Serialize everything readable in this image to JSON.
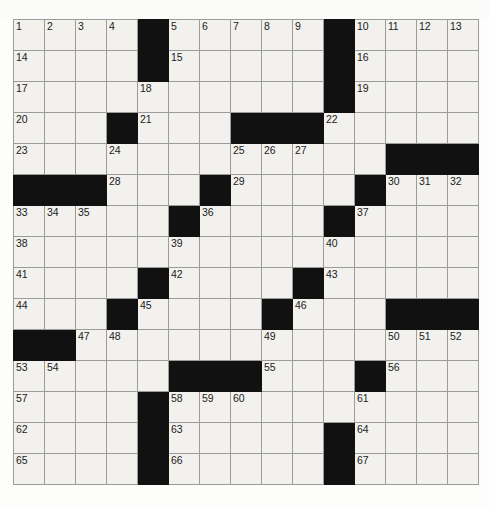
{
  "puzzle": {
    "title": "Crossword Grid",
    "rows": 15,
    "cols": 15,
    "cell_size_px": 30,
    "colors": {
      "page_background": "#fdfdfc",
      "cell_fill": "#f2f1ee",
      "block_fill": "#111111",
      "grid_line": "#9b9b9b",
      "border": "#8a8a8a",
      "number_text": "#1b1b1b"
    },
    "block_count": 72,
    "white_count": 153,
    "max_clue_number": 67,
    "grid": [
      [
        0,
        0,
        0,
        0,
        1,
        0,
        0,
        0,
        0,
        0,
        1,
        0,
        0,
        0,
        0
      ],
      [
        0,
        0,
        0,
        0,
        1,
        0,
        0,
        0,
        0,
        0,
        1,
        0,
        0,
        0,
        0
      ],
      [
        0,
        0,
        0,
        0,
        0,
        0,
        0,
        0,
        0,
        0,
        1,
        0,
        0,
        0,
        0
      ],
      [
        0,
        0,
        0,
        1,
        0,
        0,
        0,
        1,
        1,
        1,
        0,
        0,
        0,
        0,
        0
      ],
      [
        0,
        0,
        0,
        0,
        0,
        0,
        0,
        0,
        0,
        0,
        0,
        0,
        1,
        1,
        1
      ],
      [
        1,
        1,
        1,
        0,
        0,
        0,
        1,
        0,
        0,
        0,
        0,
        1,
        0,
        0,
        0
      ],
      [
        0,
        0,
        0,
        0,
        0,
        1,
        0,
        0,
        0,
        0,
        1,
        0,
        0,
        0,
        0
      ],
      [
        0,
        0,
        0,
        0,
        0,
        0,
        0,
        0,
        0,
        0,
        0,
        0,
        0,
        0,
        0
      ],
      [
        0,
        0,
        0,
        0,
        1,
        0,
        0,
        0,
        0,
        1,
        0,
        0,
        0,
        0,
        0
      ],
      [
        0,
        0,
        0,
        1,
        0,
        0,
        0,
        0,
        1,
        0,
        0,
        0,
        1,
        1,
        1
      ],
      [
        1,
        1,
        0,
        0,
        0,
        0,
        0,
        0,
        0,
        0,
        0,
        0,
        0,
        0,
        0
      ],
      [
        0,
        0,
        0,
        0,
        0,
        1,
        1,
        1,
        0,
        0,
        0,
        1,
        0,
        0,
        0
      ],
      [
        0,
        0,
        0,
        0,
        1,
        0,
        0,
        0,
        0,
        0,
        0,
        0,
        0,
        0,
        0
      ],
      [
        0,
        0,
        0,
        0,
        1,
        0,
        0,
        0,
        0,
        0,
        1,
        0,
        0,
        0,
        0
      ],
      [
        0,
        0,
        0,
        0,
        1,
        0,
        0,
        0,
        0,
        0,
        1,
        0,
        0,
        0,
        0
      ]
    ],
    "numbers": [
      [
        1,
        2,
        3,
        4,
        null,
        5,
        6,
        7,
        8,
        9,
        null,
        10,
        11,
        12,
        13
      ],
      [
        14,
        null,
        null,
        null,
        null,
        15,
        null,
        null,
        null,
        null,
        null,
        16,
        null,
        null,
        null
      ],
      [
        17,
        null,
        null,
        null,
        18,
        null,
        null,
        null,
        null,
        null,
        null,
        19,
        null,
        null,
        null
      ],
      [
        20,
        null,
        null,
        null,
        21,
        null,
        null,
        null,
        null,
        null,
        22,
        null,
        null,
        null,
        null
      ],
      [
        23,
        null,
        null,
        24,
        null,
        null,
        null,
        25,
        26,
        27,
        null,
        null,
        null,
        null,
        null
      ],
      [
        null,
        null,
        null,
        28,
        null,
        null,
        null,
        29,
        null,
        null,
        null,
        null,
        30,
        31,
        32
      ],
      [
        33,
        34,
        35,
        null,
        null,
        null,
        36,
        null,
        null,
        null,
        null,
        37,
        null,
        null,
        null
      ],
      [
        38,
        null,
        null,
        null,
        null,
        39,
        null,
        null,
        null,
        null,
        40,
        null,
        null,
        null,
        null
      ],
      [
        41,
        null,
        null,
        null,
        null,
        42,
        null,
        null,
        null,
        null,
        43,
        null,
        null,
        null,
        null
      ],
      [
        44,
        null,
        null,
        null,
        45,
        null,
        null,
        null,
        null,
        46,
        null,
        null,
        null,
        null,
        null
      ],
      [
        null,
        null,
        47,
        48,
        null,
        null,
        null,
        null,
        49,
        null,
        null,
        null,
        50,
        51,
        52
      ],
      [
        53,
        54,
        null,
        null,
        null,
        null,
        null,
        null,
        55,
        null,
        null,
        null,
        56,
        null,
        null
      ],
      [
        57,
        null,
        null,
        null,
        null,
        58,
        59,
        60,
        null,
        null,
        null,
        61,
        null,
        null,
        null
      ],
      [
        62,
        null,
        null,
        null,
        null,
        63,
        null,
        null,
        null,
        null,
        null,
        64,
        null,
        null,
        null
      ],
      [
        65,
        null,
        null,
        null,
        null,
        66,
        null,
        null,
        null,
        null,
        null,
        67,
        null,
        null,
        null
      ]
    ],
    "letters": [
      [
        "",
        "",
        "",
        "",
        "",
        "",
        "",
        "",
        "",
        "",
        "",
        "",
        "",
        "",
        ""
      ],
      [
        "",
        "",
        "",
        "",
        "",
        "",
        "",
        "",
        "",
        "",
        "",
        "",
        "",
        "",
        ""
      ],
      [
        "",
        "",
        "",
        "",
        "",
        "",
        "",
        "",
        "",
        "",
        "",
        "",
        "",
        "",
        ""
      ],
      [
        "",
        "",
        "",
        "",
        "",
        "",
        "",
        "",
        "",
        "",
        "",
        "",
        "",
        "",
        ""
      ],
      [
        "",
        "",
        "",
        "",
        "",
        "",
        "",
        "",
        "",
        "",
        "",
        "",
        "",
        "",
        ""
      ],
      [
        "",
        "",
        "",
        "",
        "",
        "",
        "",
        "",
        "",
        "",
        "",
        "",
        "",
        "",
        ""
      ],
      [
        "",
        "",
        "",
        "",
        "",
        "",
        "",
        "",
        "",
        "",
        "",
        "",
        "",
        "",
        ""
      ],
      [
        "",
        "",
        "",
        "",
        "",
        "",
        "",
        "",
        "",
        "",
        "",
        "",
        "",
        "",
        ""
      ],
      [
        "",
        "",
        "",
        "",
        "",
        "",
        "",
        "",
        "",
        "",
        "",
        "",
        "",
        "",
        ""
      ],
      [
        "",
        "",
        "",
        "",
        "",
        "",
        "",
        "",
        "",
        "",
        "",
        "",
        "",
        "",
        ""
      ],
      [
        "",
        "",
        "",
        "",
        "",
        "",
        "",
        "",
        "",
        "",
        "",
        "",
        "",
        "",
        ""
      ],
      [
        "",
        "",
        "",
        "",
        "",
        "",
        "",
        "",
        "",
        "",
        "",
        "",
        "",
        "",
        ""
      ],
      [
        "",
        "",
        "",
        "",
        "",
        "",
        "",
        "",
        "",
        "",
        "",
        "",
        "",
        "",
        ""
      ],
      [
        "",
        "",
        "",
        "",
        "",
        "",
        "",
        "",
        "",
        "",
        "",
        "",
        "",
        "",
        ""
      ],
      [
        "",
        "",
        "",
        "",
        "",
        "",
        "",
        "",
        "",
        "",
        "",
        "",
        "",
        "",
        ""
      ]
    ]
  }
}
